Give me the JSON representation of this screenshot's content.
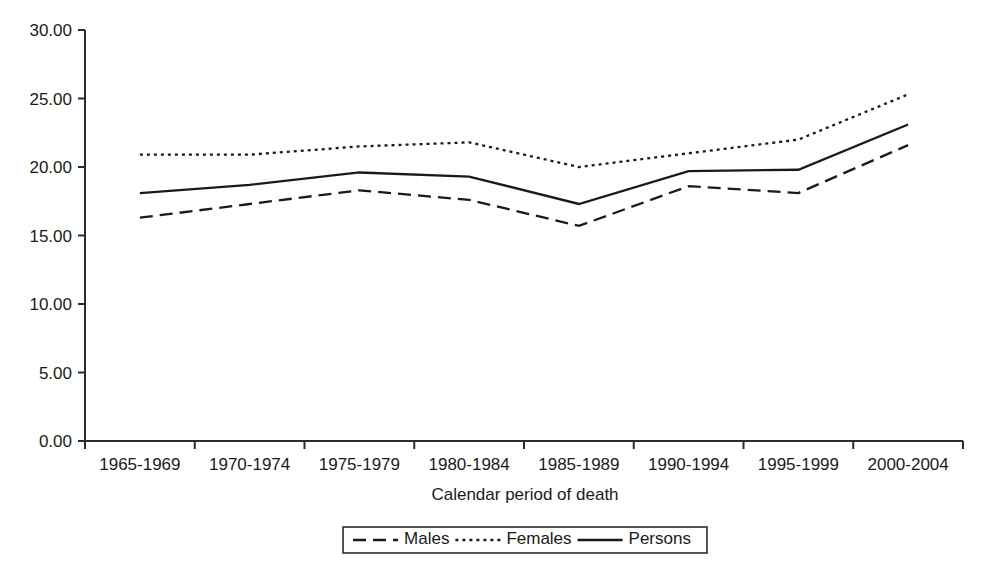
{
  "chart_data": {
    "type": "line",
    "title": "",
    "xlabel": "Calendar period of death",
    "ylabel": "",
    "categories": [
      "1965-1969",
      "1970-1974",
      "1975-1979",
      "1980-1984",
      "1985-1989",
      "1990-1994",
      "1995-1999",
      "2000-2004"
    ],
    "ylim": [
      0.0,
      30.0
    ],
    "yticks": [
      "0.00",
      "5.00",
      "10.00",
      "15.00",
      "20.00",
      "25.00",
      "30.00"
    ],
    "ytick_values": [
      0.0,
      5.0,
      10.0,
      15.0,
      20.0,
      25.0,
      30.0
    ],
    "grid": false,
    "legend_position": "bottom-center",
    "series": [
      {
        "name": "Males",
        "style": "dashed",
        "values": [
          16.3,
          17.3,
          18.3,
          17.6,
          15.7,
          18.6,
          18.1,
          21.6
        ]
      },
      {
        "name": "Females",
        "style": "dotted",
        "values": [
          20.9,
          20.9,
          21.5,
          21.8,
          20.0,
          21.0,
          22.0,
          25.3
        ]
      },
      {
        "name": "Persons",
        "style": "solid",
        "values": [
          18.1,
          18.7,
          19.6,
          19.3,
          17.3,
          19.7,
          19.8,
          23.1
        ]
      }
    ]
  },
  "legend": {
    "items": [
      {
        "label": "Males",
        "style": "dashed"
      },
      {
        "label": "Females",
        "style": "dotted"
      },
      {
        "label": "Persons",
        "style": "solid"
      }
    ]
  }
}
